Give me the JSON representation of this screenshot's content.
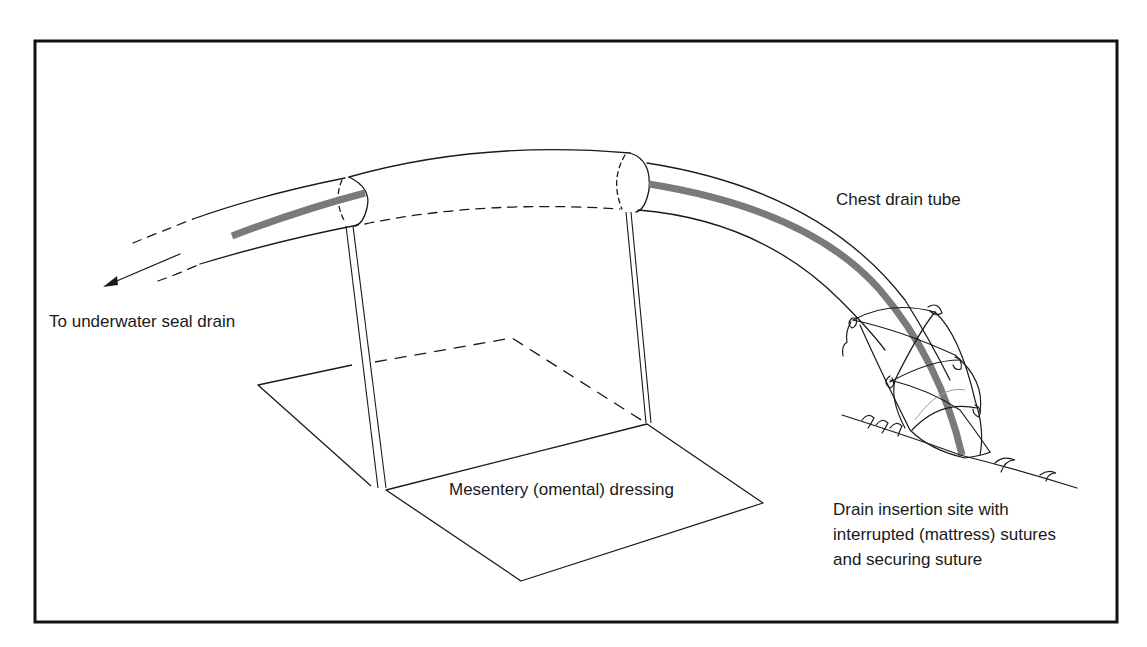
{
  "diagram": {
    "labels": {
      "chest_drain_tube": "Chest drain tube",
      "underwater_seal": "To underwater seal drain",
      "mesentery": "Mesentery (omental) dressing",
      "insertion_site": [
        "Drain insertion site with",
        "interrupted (mattress) sutures",
        "and securing suture"
      ]
    },
    "colors": {
      "frame": "#111111",
      "line": "#1a1a1a",
      "tube_core": "#7a7a7a",
      "suture_light": "#9a9a9a",
      "background": "#ffffff"
    }
  }
}
